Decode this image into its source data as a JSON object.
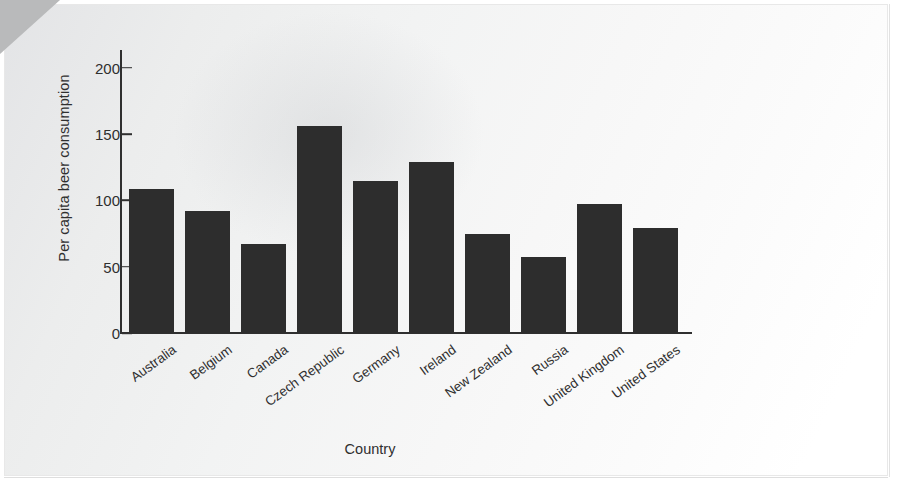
{
  "chart_data": {
    "type": "bar",
    "title": "",
    "xlabel": "Country",
    "ylabel": "Per capita beer consumption",
    "categories": [
      "Australia",
      "Belgium",
      "Canada",
      "Czech Republic",
      "Germany",
      "Ireland",
      "New Zealand",
      "Russia",
      "United Kingdom",
      "United States"
    ],
    "values": [
      109,
      92,
      67,
      156,
      115,
      129,
      75,
      57,
      97,
      79
    ],
    "ylim": [
      0,
      215
    ],
    "yticks": [
      0,
      50,
      100,
      150,
      200
    ],
    "ytick_labels": [
      "0",
      "50",
      "100",
      "150",
      "200"
    ],
    "grid": false,
    "legend": null,
    "bar_color": "#2d2d2d",
    "axis_color": "#2f2f2f",
    "page_background": "#f2f3f3"
  },
  "figure": {
    "corner_fold_color": "#b9babb"
  }
}
